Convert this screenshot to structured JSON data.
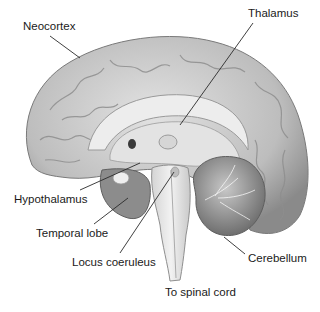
{
  "diagram": {
    "labels": [
      {
        "id": "neocortex",
        "text": "Neocortex",
        "x": 23,
        "y": 20,
        "line": [
          50,
          36,
          80,
          58
        ]
      },
      {
        "id": "thalamus",
        "text": "Thalamus",
        "x": 248,
        "y": 7,
        "line": [
          253,
          23,
          180,
          125
        ]
      },
      {
        "id": "hypothalamus",
        "text": "Hypothalamus",
        "x": 14,
        "y": 193,
        "line": [
          80,
          190,
          140,
          163
        ]
      },
      {
        "id": "temporal-lobe",
        "text": "Temporal lobe",
        "x": 36,
        "y": 227,
        "line": [
          94,
          224,
          128,
          198
        ]
      },
      {
        "id": "locus-coeruleus",
        "text": "Locus coeruleus",
        "x": 72,
        "y": 256,
        "line": [
          120,
          253,
          174,
          172
        ]
      },
      {
        "id": "cerebellum",
        "text": "Cerebellum",
        "x": 248,
        "y": 252,
        "line": [
          245,
          254,
          224,
          237
        ]
      },
      {
        "id": "to-spinal-cord",
        "text": "To spinal cord",
        "x": 165,
        "y": 286,
        "line": null
      }
    ]
  },
  "colors": {
    "background": "#ffffff",
    "label_text": "#1a1a1a",
    "leader_line": "#2a2a2a",
    "cortex_fill": "#c9c9c9",
    "cortex_shadow": "#8f8f8f",
    "inner_fill": "#e6e6e6",
    "cerebellum_fill": "#a8a8a8",
    "stem_fill": "#ececec"
  }
}
